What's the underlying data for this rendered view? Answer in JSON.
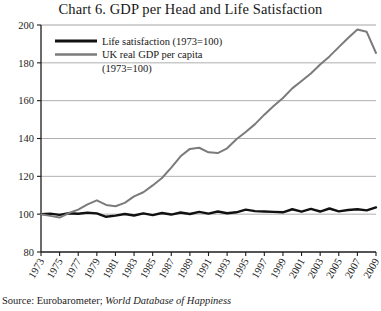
{
  "chart_data": {
    "type": "line",
    "title": "Chart 6. GDP per Head and Life Satisfaction",
    "xlabel": "",
    "ylabel": "",
    "ylim": [
      80,
      200
    ],
    "xlim": [
      1973,
      2009
    ],
    "yticks": [
      80,
      100,
      120,
      140,
      160,
      180,
      200
    ],
    "grid": "horizontal",
    "legend_position": "top-left",
    "x": [
      1973,
      1974,
      1975,
      1976,
      1977,
      1978,
      1979,
      1980,
      1981,
      1982,
      1983,
      1984,
      1985,
      1986,
      1987,
      1988,
      1989,
      1990,
      1991,
      1992,
      1993,
      1994,
      1995,
      1996,
      1997,
      1998,
      1999,
      2000,
      2001,
      2002,
      2003,
      2004,
      2005,
      2006,
      2007,
      2008,
      2009
    ],
    "xtick_labels": [
      "1973",
      "1975",
      "1977",
      "1979",
      "1981",
      "1983",
      "1985",
      "1987",
      "1989",
      "1991",
      "1993",
      "1995",
      "1997",
      "1999",
      "2001",
      "2003",
      "2005",
      "2007",
      "2009"
    ],
    "series": [
      {
        "name": "Life satisfaction (1973=100)",
        "color": "#111111",
        "width": 2.4,
        "values": [
          100,
          100.3,
          99.6,
          100.5,
          100.2,
          100.8,
          100.4,
          98.6,
          99.2,
          100.1,
          99.3,
          100.4,
          99.5,
          100.6,
          99.8,
          100.9,
          100.1,
          101.2,
          100.3,
          101.4,
          100.5,
          101.0,
          102.4,
          101.6,
          101.4,
          101.2,
          101.0,
          102.6,
          101.3,
          102.8,
          101.4,
          103.0,
          101.5,
          102.2,
          102.6,
          102.0,
          103.6
        ]
      },
      {
        "name": "UK real GDP per capita (1973=100)",
        "color": "#7b7b7b",
        "width": 2.0,
        "values": [
          100,
          99.1,
          98.2,
          100.6,
          102.4,
          105.2,
          107.3,
          104.9,
          104.2,
          106.0,
          109.4,
          111.6,
          115.2,
          119.1,
          124.6,
          130.6,
          134.5,
          135.1,
          132.7,
          132.3,
          134.8,
          139.6,
          143.4,
          147.6,
          152.6,
          157.2,
          161.4,
          166.5,
          170.4,
          174.4,
          179.1,
          183.4,
          188.3,
          193.1,
          197.6,
          196.4,
          185.2
        ]
      }
    ],
    "legend": [
      {
        "label": "Life satisfaction (1973=100)",
        "color": "#111111"
      },
      {
        "label": "UK real GDP per capita",
        "label2": "(1973=100)",
        "color": "#7b7b7b"
      }
    ]
  },
  "source": {
    "prefix": "Source: Eurobarometer; ",
    "database": "World Database of Happiness"
  }
}
